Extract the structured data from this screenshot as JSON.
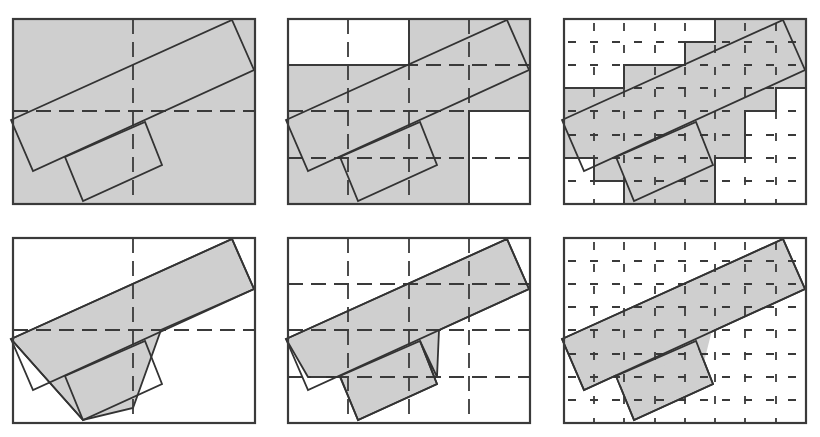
{
  "figure": {
    "colors": {
      "fill": "#cfcfcf",
      "stroke": "#333333",
      "background": "#ffffff"
    },
    "panels": [
      {
        "id": "top-left",
        "row": 1,
        "col": 1,
        "grid_divisions": 2,
        "mode": "occupied-cells",
        "label": ""
      },
      {
        "id": "top-middle",
        "row": 1,
        "col": 2,
        "grid_divisions": 4,
        "mode": "occupied-cells",
        "label": ""
      },
      {
        "id": "top-right",
        "row": 1,
        "col": 3,
        "grid_divisions": 8,
        "mode": "occupied-cells",
        "label": ""
      },
      {
        "id": "bottom-left",
        "row": 2,
        "col": 1,
        "grid_divisions": 2,
        "mode": "convex-hull",
        "label": ""
      },
      {
        "id": "bottom-middle",
        "row": 2,
        "col": 2,
        "grid_divisions": 4,
        "mode": "clipped-hull",
        "label": ""
      },
      {
        "id": "bottom-right",
        "row": 2,
        "col": 3,
        "grid_divisions": 8,
        "mode": "exact-shape",
        "label": ""
      }
    ],
    "shapes": {
      "large_rectangle": "rotated rectangle spanning panel diagonally",
      "small_rectangle": "rotated rectangle below large one"
    }
  }
}
